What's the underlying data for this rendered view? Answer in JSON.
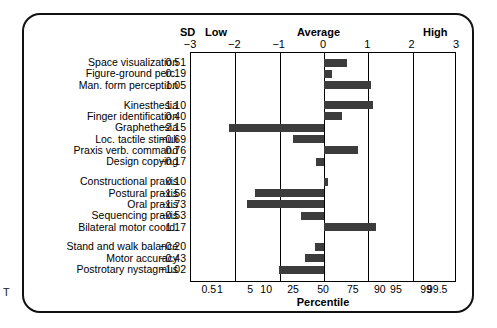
{
  "header": {
    "sd": "SD",
    "low": "Low",
    "average": "Average",
    "high": "High"
  },
  "axes": {
    "top_label": "SD",
    "top_ticks": [
      "−3",
      "−2",
      "−1",
      "0",
      "1",
      "2",
      "3"
    ],
    "bottom_title": "Percentile",
    "bottom_ticks": [
      "0.5",
      "1",
      "5",
      "10",
      "25",
      "50",
      "75",
      "90",
      "95",
      "99",
      "99.5"
    ]
  },
  "colors": {
    "bar": "#3c3c3c",
    "frame": "#111111",
    "axis": "#000000"
  },
  "chart_data": {
    "type": "bar",
    "orientation": "horizontal",
    "title": "",
    "xlabel": "Percentile",
    "ylabel": "",
    "xlim": [
      -3,
      3
    ],
    "grid": true,
    "legend": "none",
    "x_axis_top_label": "SD",
    "x_axis_top_ticks": [
      -3,
      -2,
      -1,
      0,
      1,
      2,
      3
    ],
    "x_axis_bottom_ticks": [
      0.5,
      1,
      5,
      10,
      25,
      50,
      75,
      90,
      95,
      99,
      99.5
    ],
    "zones": [
      "Low",
      "Average",
      "High"
    ],
    "categories": [
      "Space visualization",
      "Figure-ground perc.",
      "Man. form perception",
      "Kinesthesia",
      "Finger identification",
      "Graphethesia",
      "Loc. tactile stimuli",
      "Praxis verb. command",
      "Design copying",
      "Constructional praxis",
      "Postural praxis",
      "Oral praxis",
      "Sequencing praxis",
      "Bilateral motor coord.",
      "Stand and walk balance",
      "Motor accuracy",
      "Postrotary nystagmus"
    ],
    "values": [
      0.51,
      0.19,
      1.05,
      1.1,
      0.4,
      -2.15,
      -0.69,
      0.76,
      -0.17,
      0.1,
      -1.56,
      -1.73,
      -0.53,
      1.17,
      -0.2,
      -0.43,
      -1.02
    ],
    "value_labels": [
      "0.51",
      "0.19",
      "1.05",
      "1.10",
      "0.40",
      "−2.15",
      "−0.69",
      "0.76",
      "−0.17",
      "0.10",
      "−1.56",
      "−1.73",
      "−0.53",
      "1.17",
      "−0.20",
      "−0.43",
      "−1.02"
    ],
    "group_breaks_after": [
      2,
      8,
      13
    ],
    "groups": [
      {
        "rows": [
          "Space visualization",
          "Figure-ground perc.",
          "Man. form perception"
        ]
      },
      {
        "rows": [
          "Kinesthesia",
          "Finger identification",
          "Graphethesia",
          "Loc. tactile stimuli",
          "Praxis verb. command",
          "Design copying"
        ]
      },
      {
        "rows": [
          "Constructional praxis",
          "Postural praxis",
          "Oral praxis",
          "Sequencing praxis",
          "Bilateral motor coord."
        ]
      },
      {
        "rows": [
          "Stand and walk balance",
          "Motor accuracy",
          "Postrotary nystagmus"
        ]
      }
    ]
  },
  "artifact": "T"
}
